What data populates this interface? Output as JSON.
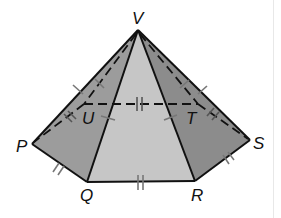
{
  "figure": {
    "type": "hexagonal pyramid",
    "apex": {
      "label": "V",
      "x": 138,
      "y": 30
    },
    "base_vertices": [
      {
        "label": "P",
        "x": 32,
        "y": 144
      },
      {
        "label": "Q",
        "x": 87,
        "y": 182
      },
      {
        "label": "R",
        "x": 195,
        "y": 181
      },
      {
        "label": "S",
        "x": 250,
        "y": 140
      },
      {
        "label": "T",
        "x": 198,
        "y": 104
      },
      {
        "label": "U",
        "x": 84,
        "y": 104
      }
    ],
    "labels": {
      "V": "V",
      "P": "P",
      "Q": "Q",
      "R": "R",
      "S": "S",
      "T": "T",
      "U": "U"
    },
    "colors": {
      "left_face": "#9a9a9a",
      "front_face": "#c4c4c4",
      "right_face": "#8a8a8a",
      "edges": "#111111",
      "tick_marks": "#777777",
      "background": "#ffffff"
    },
    "congruence_marks": {
      "base_edges": "double tick (PQ, QR, RS, ST, TU, UP)",
      "lateral_edges": "single tick (VP, VQ, VR, VS, VT, VU)"
    },
    "hidden_edges": [
      "VU",
      "VT",
      "UT",
      "PU",
      "TS"
    ]
  }
}
